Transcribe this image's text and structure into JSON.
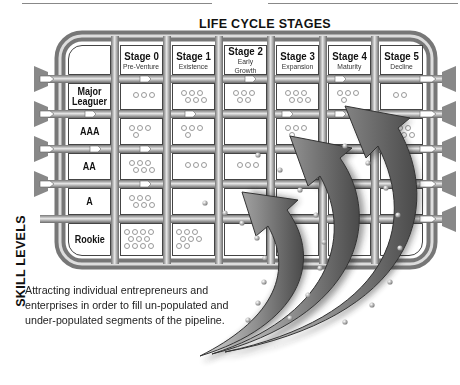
{
  "diagram": {
    "title": "LIFE CYCLE STAGES",
    "side_label": "SKILL LEVELS",
    "stages": [
      {
        "label": "Stage 0",
        "sub": "Pre-Venture"
      },
      {
        "label": "Stage 1",
        "sub": "Existence"
      },
      {
        "label": "Stage 2",
        "sub": "Early Growth"
      },
      {
        "label": "Stage 3",
        "sub": "Expansion"
      },
      {
        "label": "Stage 4",
        "sub": "Maturity"
      },
      {
        "label": "Stage 5",
        "sub": "Decline"
      }
    ],
    "levels": [
      {
        "label": "Major Leaguer"
      },
      {
        "label": "AAA"
      },
      {
        "label": "AA"
      },
      {
        "label": "A"
      },
      {
        "label": "Rookie"
      }
    ],
    "populations": [
      [
        3,
        6,
        5,
        6,
        4,
        2
      ],
      [
        4,
        4,
        0,
        4,
        0,
        6
      ],
      [
        6,
        3,
        3,
        0,
        0,
        0
      ],
      [
        6,
        0,
        0,
        0,
        0,
        0
      ],
      [
        11,
        8,
        0,
        0,
        0,
        0
      ]
    ],
    "caption": "Attracting individual entrepreneurs and enterprises in order to fill un-populated and under-populated segments of the pipeline.",
    "colors": {
      "pipe": "#8a8a8a",
      "pipe_light": "#d8d8d8",
      "arrow": "#9a9a9a",
      "cell_border": "#444444"
    }
  }
}
